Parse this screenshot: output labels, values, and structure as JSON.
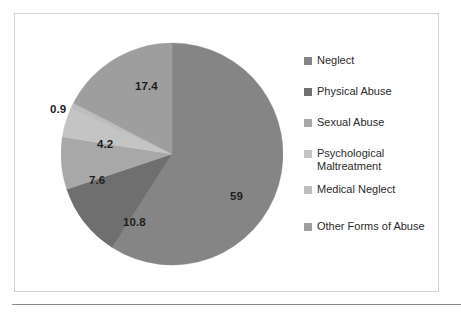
{
  "chart_data": {
    "type": "pie",
    "title": "",
    "subtitle": "",
    "xlabel": "",
    "ylabel": "",
    "legend_position": "right",
    "grid": false,
    "start_angle_deg": 0,
    "direction": "clockwise",
    "categories": [
      "Neglect",
      "Physical Abuse",
      "Sexual Abuse",
      "Psychological Maltreatment",
      "Medical Neglect",
      "Other Forms of Abuse"
    ],
    "values": [
      59,
      10.8,
      7.6,
      4.2,
      0.9,
      17.4
    ],
    "labels": [
      "59",
      "10.8",
      "7.6",
      "4.2",
      "0.9",
      "17.4"
    ],
    "colors": [
      "#858585",
      "#6f6f6f",
      "#a8a8a8",
      "#c4c4c4",
      "#bdbdbd",
      "#9e9e9e"
    ],
    "slices": [
      {
        "name": "Neglect",
        "value": 59,
        "label": "59",
        "color": "#858585"
      },
      {
        "name": "Physical Abuse",
        "value": 10.8,
        "label": "10.8",
        "color": "#6f6f6f"
      },
      {
        "name": "Sexual Abuse",
        "value": 7.6,
        "label": "7.6",
        "color": "#a8a8a8"
      },
      {
        "name": "Psychological Maltreatment",
        "value": 4.2,
        "label": "4.2",
        "color": "#c4c4c4"
      },
      {
        "name": "Medical Neglect",
        "value": 0.9,
        "label": "0.9",
        "color": "#bdbdbd"
      },
      {
        "name": "Other Forms of Abuse",
        "value": 17.4,
        "label": "17.4",
        "color": "#9e9e9e"
      }
    ]
  },
  "legend": {
    "items": [
      {
        "label": "Neglect",
        "color": "#858585"
      },
      {
        "label": "Physical Abuse",
        "color": "#6f6f6f"
      },
      {
        "label": "Sexual Abuse",
        "color": "#a8a8a8"
      },
      {
        "label": "Psychological Maltreatment",
        "color": "#c4c4c4"
      },
      {
        "label": "Medical Neglect",
        "color": "#bdbdbd"
      },
      {
        "label": "Other Forms of Abuse",
        "color": "#9e9e9e"
      }
    ]
  },
  "legend_lines": {
    "psychological_line1": "Psychological",
    "psychological_line2": "Maltreatment"
  }
}
